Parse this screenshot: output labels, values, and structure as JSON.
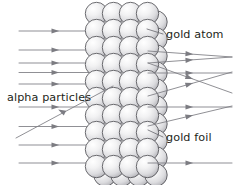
{
  "diagram": {
    "background_color": "#ffffff",
    "width": 244,
    "height": 185,
    "labels": [
      {
        "id": "gold-atom",
        "text": "gold atom",
        "x": 166,
        "y": 38,
        "anchor": "start",
        "leader": {
          "x1": 163,
          "y1": 34,
          "x2": 147,
          "y2": 29
        }
      },
      {
        "id": "alpha-particles",
        "text": "alpha particles",
        "x": 7,
        "y": 101,
        "anchor": "start",
        "leader": null
      },
      {
        "id": "gold-foil",
        "text": "gold foil",
        "x": 166,
        "y": 141,
        "anchor": "start",
        "leader": {
          "x1": 163,
          "y1": 137,
          "x2": 148,
          "y2": 130
        }
      }
    ],
    "foil": {
      "label": "gold foil lattice",
      "atom_color_light": "#fdfdfd",
      "atom_color_mid": "#e3e3e5",
      "atom_color_dark": "#b9b9bd",
      "atom_stroke": "#4a4a4f",
      "atom_radius": 11.2,
      "columns_x": [
        96.5,
        113.5,
        130.5,
        147.5
      ],
      "rows_even_y": [
        13.5,
        30.5,
        47.5,
        64.5,
        81.5,
        98.5,
        115.5,
        132.5,
        149.5,
        166.5
      ],
      "rows_odd_y": [
        22.0,
        39.0,
        56.0,
        73.0,
        90.0,
        107.0,
        124.0,
        141.0,
        158.0,
        175.0
      ],
      "atom_count": 80
    },
    "ray_color": "#7c7c82",
    "rays_incoming": [
      {
        "id": "in-1",
        "y": 31.0,
        "x1": 19,
        "x2": 96,
        "arrow_x": 56
      },
      {
        "id": "in-2",
        "y": 50.0,
        "x1": 19,
        "x2": 96,
        "arrow_x": 56
      },
      {
        "id": "in-3",
        "y": 63.0,
        "x1": 19,
        "x2": 96,
        "arrow_x": 56
      },
      {
        "id": "in-4",
        "y": 72.5,
        "x1": 19,
        "x2": 96,
        "arrow_x": 56
      },
      {
        "id": "in-5",
        "y": 84.0,
        "x1": 19,
        "x2": 96,
        "arrow_x": 56
      },
      {
        "id": "in-6",
        "y": 107.0,
        "x1": 19,
        "x2": 96,
        "arrow_x": 56
      },
      {
        "id": "in-7",
        "y": 126.5,
        "x1": 19,
        "x2": 96,
        "arrow_x": 56
      },
      {
        "id": "in-8",
        "y": 145.0,
        "x1": 19,
        "x2": 96,
        "arrow_x": 56
      },
      {
        "id": "in-9",
        "y": 163.0,
        "x1": 19,
        "x2": 96,
        "arrow_x": 56
      }
    ],
    "rays_backscattered": [
      {
        "id": "back-1",
        "comment": "alpha particle deflected back through the foil toward lower left",
        "points": "113,86 16,138",
        "arrow_x": 61,
        "arrow_y": 111,
        "arrow_angle": 208
      }
    ],
    "rays_outgoing": [
      {
        "id": "out-1",
        "points": "148,51 232,57",
        "arrow_x": 190,
        "arrow_y": 54,
        "arrow_angle": 4
      },
      {
        "id": "out-2",
        "points": "148,63 232,57",
        "arrow_x": 190,
        "arrow_y": 60,
        "arrow_angle": -4
      },
      {
        "id": "out-3",
        "points": "148,73 232,73",
        "arrow_x": 190,
        "arrow_y": 73,
        "arrow_angle": 0
      },
      {
        "id": "out-4",
        "points": "148,63 232,93",
        "arrow_x": 190,
        "arrow_y": 78,
        "arrow_angle": 20
      },
      {
        "id": "out-5",
        "points": "148,96 232,72",
        "arrow_x": 190,
        "arrow_y": 84,
        "arrow_angle": -16
      },
      {
        "id": "out-6",
        "points": "148,107 232,107",
        "arrow_x": 190,
        "arrow_y": 107,
        "arrow_angle": 0
      },
      {
        "id": "out-7",
        "points": "148,126 232,106",
        "arrow_x": 190,
        "arrow_y": 116,
        "arrow_angle": -14
      },
      {
        "id": "out-8",
        "points": "148,163 232,163",
        "arrow_x": 190,
        "arrow_y": 163,
        "arrow_angle": 0
      }
    ]
  }
}
